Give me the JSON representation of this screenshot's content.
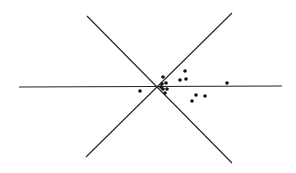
{
  "diagram": {
    "background": "#ffffff",
    "stroke_color": "#222222",
    "dot_color": "#111111",
    "lines": [
      {
        "name": "horizontal-axis",
        "x1": 19,
        "y1": 87,
        "x2": 282,
        "y2": 86
      },
      {
        "name": "diagonal-descending",
        "x1": 87,
        "y1": 16,
        "x2": 232,
        "y2": 163
      },
      {
        "name": "diagonal-ascending",
        "x1": 232,
        "y1": 13,
        "x2": 86,
        "y2": 157
      }
    ],
    "points": [
      {
        "x": 163,
        "y": 77
      },
      {
        "x": 166,
        "y": 83
      },
      {
        "x": 162,
        "y": 84
      },
      {
        "x": 161,
        "y": 87
      },
      {
        "x": 167,
        "y": 89
      },
      {
        "x": 163,
        "y": 89
      },
      {
        "x": 165,
        "y": 93
      },
      {
        "x": 140,
        "y": 91
      },
      {
        "x": 180,
        "y": 80
      },
      {
        "x": 186,
        "y": 79
      },
      {
        "x": 185,
        "y": 71
      },
      {
        "x": 227,
        "y": 83
      },
      {
        "x": 196,
        "y": 95
      },
      {
        "x": 205,
        "y": 96
      },
      {
        "x": 192,
        "y": 101
      }
    ]
  }
}
